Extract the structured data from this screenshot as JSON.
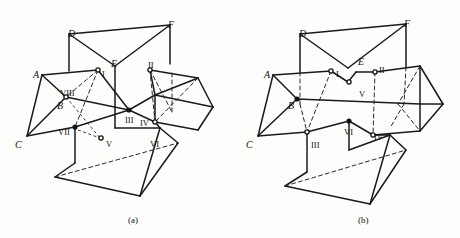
{
  "figure": {
    "background_color": "#fdfdfc",
    "stroke_color": "#1a1a1a",
    "panels": [
      {
        "id": "panel-a",
        "caption": "(a)",
        "caption_pos": {
          "x": 128,
          "y": 216
        },
        "vertex_labels": [
          {
            "text": "A",
            "x": 33,
            "y": 70
          },
          {
            "text": "B",
            "x": 57,
            "y": 101
          },
          {
            "text": "C",
            "x": 15,
            "y": 140
          },
          {
            "text": "D",
            "x": 68,
            "y": 29
          },
          {
            "text": "E",
            "x": 111,
            "y": 59
          },
          {
            "text": "F",
            "x": 168,
            "y": 20
          }
        ],
        "roman_labels": [
          {
            "text": "I",
            "x": 102,
            "y": 70
          },
          {
            "text": "II",
            "x": 148,
            "y": 61
          },
          {
            "text": "III",
            "x": 125,
            "y": 116
          },
          {
            "text": "IV",
            "x": 140,
            "y": 119
          },
          {
            "text": "V",
            "x": 106,
            "y": 140
          },
          {
            "text": "VI",
            "x": 150,
            "y": 140
          },
          {
            "text": "VII",
            "x": 58,
            "y": 128
          },
          {
            "text": "VIII",
            "x": 60,
            "y": 89
          }
        ]
      },
      {
        "id": "panel-b",
        "caption": "(b)",
        "caption_pos": {
          "x": 358,
          "y": 216
        },
        "vertex_labels": [
          {
            "text": "A",
            "x": 264,
            "y": 70
          },
          {
            "text": "B",
            "x": 288,
            "y": 101
          },
          {
            "text": "C",
            "x": 246,
            "y": 140
          },
          {
            "text": "D",
            "x": 299,
            "y": 29
          },
          {
            "text": "E",
            "x": 358,
            "y": 57
          },
          {
            "text": "F",
            "x": 404,
            "y": 19
          }
        ],
        "roman_labels": [
          {
            "text": "I",
            "x": 336,
            "y": 70
          },
          {
            "text": "II",
            "x": 379,
            "y": 66
          },
          {
            "text": "III",
            "x": 311,
            "y": 141
          },
          {
            "text": "IV",
            "x": 374,
            "y": 133
          },
          {
            "text": "V",
            "x": 359,
            "y": 90
          },
          {
            "text": "VI",
            "x": 344,
            "y": 128
          }
        ]
      }
    ]
  },
  "geometry": {
    "panel_a": {
      "solid_edges": [
        "M 69,34 L 170,25",
        "M 69,34 L 115,66",
        "M 115,66 L 170,25",
        "M 170,25 L 170,64",
        "M 69,34 L 69,71",
        "M 115,66 L 115,128",
        "M 42,75 L 98,70",
        "M 42,75 L 66,97",
        "M 42,75 L 27,136",
        "M 27,136 L 66,97",
        "M 66,97 L 129,110",
        "M 98,70 L 129,110",
        "M 27,136 L 75,127",
        "M 75,127 L 129,110",
        "M 129,110 L 155,95",
        "M 129,110 L 155,122",
        "M 155,95 L 198,78",
        "M 155,95 L 150,70",
        "M 150,70 L 198,78",
        "M 198,78 L 213,107",
        "M 213,107 L 198,130",
        "M 155,122 L 198,130",
        "M 155,95 L 213,107",
        "M 155,122 L 155,95",
        "M 75,127 L 75,163",
        "M 75,163 L 55,177",
        "M 55,177 L 140,196",
        "M 140,196 L 160,128",
        "M 160,128 L 155,122",
        "M 140,196 L 178,143",
        "M 178,143 L 160,128",
        "M 115,128 L 160,128"
      ],
      "hidden_edges": [
        "M 98,70 L 66,97",
        "M 98,70 L 75,127",
        "M 150,70 L 155,122",
        "M 150,70 L 172,112",
        "M 172,112 L 172,72",
        "M 198,78 L 155,122",
        "M 55,177 L 178,143"
      ],
      "leader_lines": [
        "M 66,97 L 100,138",
        "M 78,130 L 100,138"
      ],
      "nodes": [
        {
          "x": 98,
          "y": 70,
          "type": "open"
        },
        {
          "x": 66,
          "y": 97,
          "type": "open"
        },
        {
          "x": 129,
          "y": 110,
          "type": "filled"
        },
        {
          "x": 150,
          "y": 70,
          "type": "open"
        },
        {
          "x": 155,
          "y": 122,
          "type": "open"
        },
        {
          "x": 75,
          "y": 127,
          "type": "filled"
        },
        {
          "x": 101,
          "y": 138,
          "type": "open"
        }
      ]
    },
    "panel_b": {
      "solid_edges": [
        "M 300,34 L 406,24",
        "M 300,34 L 348,68",
        "M 348,68 L 406,24",
        "M 406,24 L 406,67",
        "M 300,34 L 300,72",
        "M 273,75 L 331,71",
        "M 273,75 L 297,99",
        "M 273,75 L 258,136",
        "M 258,136 L 297,99",
        "M 297,99 L 420,104",
        "M 258,136 L 307,132",
        "M 307,132 L 349,121",
        "M 349,121 L 373,135",
        "M 373,135 L 420,131",
        "M 331,71 L 348,82",
        "M 348,82 L 356,72",
        "M 356,72 L 375,72",
        "M 375,72 L 420,66",
        "M 420,66 L 443,104",
        "M 443,104 L 420,131",
        "M 420,104 L 443,104",
        "M 420,66 L 420,104",
        "M 420,104 L 420,131",
        "M 307,132 L 307,172",
        "M 307,172 L 285,186",
        "M 285,186 L 370,204",
        "M 370,204 L 390,135",
        "M 390,135 L 373,135",
        "M 370,204 L 406,150",
        "M 406,150 L 390,135",
        "M 349,121 L 349,150",
        "M 349,150 L 390,135"
      ],
      "hidden_edges": [
        "M 331,71 L 307,132",
        "M 300,72 L 300,104",
        "M 300,104 L 307,132",
        "M 375,72 L 373,135",
        "M 406,67 L 404,104",
        "M 404,104 L 390,128",
        "M 420,66 L 398,104",
        "M 398,104 L 420,131",
        "M 285,186 L 406,150"
      ],
      "leader_lines": [],
      "nodes": [
        {
          "x": 331,
          "y": 71,
          "type": "open"
        },
        {
          "x": 375,
          "y": 72,
          "type": "open"
        },
        {
          "x": 349,
          "y": 82,
          "type": "open"
        },
        {
          "x": 307,
          "y": 132,
          "type": "open"
        },
        {
          "x": 373,
          "y": 135,
          "type": "open"
        },
        {
          "x": 349,
          "y": 121,
          "type": "filled"
        },
        {
          "x": 297,
          "y": 99,
          "type": "filled"
        }
      ]
    }
  }
}
